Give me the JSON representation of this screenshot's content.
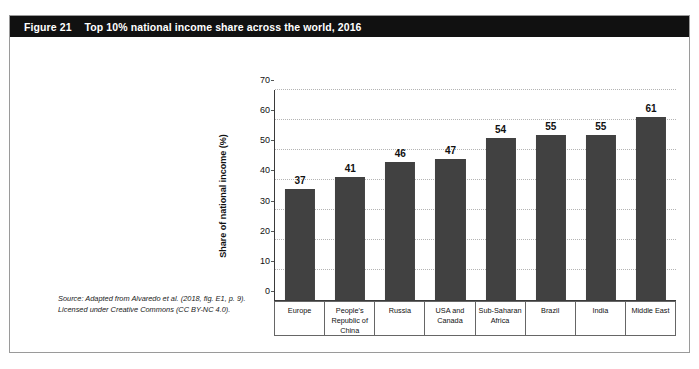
{
  "figure": {
    "label": "Figure 21",
    "title": "Top 10% national income share across the world, 2016",
    "source_line_1": "Source: Adapted from Alvaredo et al. (2018, fig. E1, p. 9).",
    "source_line_2": "Licensed under Creative Commons (CC BY-NC 4.0)."
  },
  "colors": {
    "header_background": "#111111",
    "header_text": "#ffffff",
    "bar_fill": "#414141",
    "frame_border": "#9a9a9a",
    "gridline": "#b4b4b4",
    "axis_line": "#3a3a3a"
  },
  "chart_data": {
    "type": "bar",
    "title": "Top 10% national income share across the world, 2016",
    "xlabel": "",
    "ylabel": "Share of national income (%)",
    "ylim": [
      0,
      70
    ],
    "ytick_step": 10,
    "yticks": [
      0,
      10,
      20,
      30,
      40,
      50,
      60,
      70
    ],
    "ytick_labels": [
      "0",
      "10",
      "20",
      "30",
      "40",
      "50",
      "60",
      "70"
    ],
    "grid": true,
    "grid_style": "dotted-horizontal",
    "legend": false,
    "orientation": "vertical",
    "categories": [
      "Europe",
      "People's\nRepublic of\nChina",
      "Russia",
      "USA and\nCanada",
      "Sub-Saharan\nAfrica",
      "Brazil",
      "India",
      "Middle East"
    ],
    "values": [
      37,
      41,
      46,
      47,
      54,
      55,
      55,
      61
    ],
    "value_labels": [
      "37",
      "41",
      "46",
      "47",
      "54",
      "55",
      "55",
      "61"
    ]
  }
}
